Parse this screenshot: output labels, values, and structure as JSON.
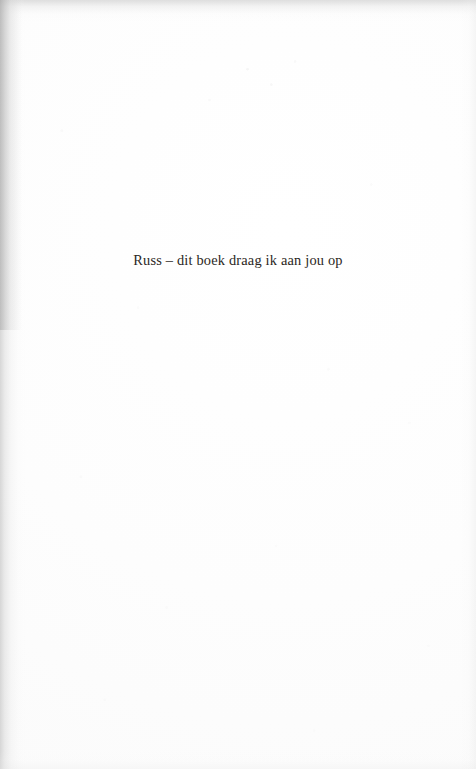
{
  "page": {
    "kind": "book-dedication-page",
    "background_color": "#fefefe",
    "ink_color": "#2b2723",
    "edge_shadow_color": "#b7b7b7"
  },
  "content": {
    "dedication_text": "Russ – dit boek draag ik aan jou op"
  }
}
